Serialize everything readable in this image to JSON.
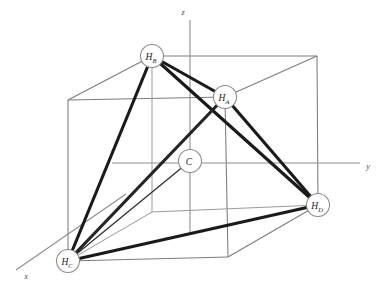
{
  "figure": {
    "background_color": "#ffffff",
    "width": 381,
    "height": 288
  },
  "colors": {
    "bond": "#1a1a1a",
    "bond_thin": "#2b2b2b",
    "cube_edge": "#7c7c7c",
    "cube_edge_hidden": "#9a9a9a",
    "axis": "#8e8e8e",
    "atom_fill": "#ffffff",
    "atom_stroke": "#8a8a8a",
    "label_text": "#1c1c1c",
    "axis_label_text": "#4a4a4a"
  },
  "axes": [
    {
      "name": "z-axis",
      "label": "z",
      "label_x": 183,
      "label_y": 12,
      "x1": 190,
      "y1": 20,
      "x2": 190,
      "y2": 232
    },
    {
      "name": "y-axis",
      "label": "y",
      "label_x": 368,
      "label_y": 166,
      "x1": 112,
      "y1": 163,
      "x2": 360,
      "y2": 163
    },
    {
      "name": "x-axis",
      "label": "x",
      "label_x": 26,
      "label_y": 276,
      "x1": 126,
      "y1": 194,
      "x2": 16,
      "y2": 270
    }
  ],
  "atoms": [
    {
      "id": "HB",
      "label": "H",
      "subscript": "B",
      "x": 152,
      "y": 56,
      "r": 11.5,
      "element": "hydrogen"
    },
    {
      "id": "HA",
      "label": "H",
      "subscript": "A",
      "x": 225,
      "y": 97,
      "r": 11.5,
      "element": "hydrogen"
    },
    {
      "id": "C",
      "label": "C",
      "subscript": "",
      "x": 190,
      "y": 161,
      "r": 11.5,
      "element": "carbon"
    },
    {
      "id": "HD",
      "label": "H",
      "subscript": "D",
      "x": 318,
      "y": 205,
      "r": 11.5,
      "element": "hydrogen"
    },
    {
      "id": "HC",
      "label": "H",
      "subscript": "C",
      "x": 68,
      "y": 261,
      "r": 11.5,
      "element": "hydrogen"
    }
  ],
  "bonds": [
    {
      "name": "bond-HB-HA",
      "from": "HB",
      "to": "HA",
      "style": "thick"
    },
    {
      "name": "bond-HB-HC",
      "from": "HB",
      "to": "HC",
      "style": "thick"
    },
    {
      "name": "bond-HB-HD",
      "from": "HB",
      "to": "HD",
      "style": "thick"
    },
    {
      "name": "bond-HA-HC",
      "from": "HA",
      "to": "HC",
      "style": "thick"
    },
    {
      "name": "bond-HA-HD",
      "from": "HA",
      "to": "HD",
      "style": "thick"
    },
    {
      "name": "bond-HC-HD",
      "from": "HC",
      "to": "HD",
      "style": "thick"
    },
    {
      "name": "bond-HC-HA-inner",
      "from": "HC",
      "to": "HA",
      "style": "thin"
    }
  ],
  "cube": {
    "name": "reference-cube",
    "vertices": {
      "top_back_left": {
        "x": 152,
        "y": 56
      },
      "top_back_right": {
        "x": 317,
        "y": 56
      },
      "top_front_left": {
        "x": 68,
        "y": 100
      },
      "top_front_right": {
        "x": 225,
        "y": 97
      },
      "bottom_back_left": {
        "x": 152,
        "y": 212
      },
      "bottom_back_right": {
        "x": 318,
        "y": 205
      },
      "bottom_front_left": {
        "x": 68,
        "y": 261
      },
      "bottom_front_right": {
        "x": 228,
        "y": 257
      }
    }
  },
  "caption": {
    "molecule": "CH4",
    "description": "methane tetrahedron in a cube"
  }
}
